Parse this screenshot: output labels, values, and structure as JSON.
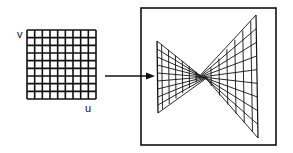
{
  "figure": {
    "colors": {
      "ink": "#111111",
      "background": "#ffffff"
    },
    "source_grid": {
      "axis_labels": {
        "v": "v",
        "u": "u"
      },
      "x": 27,
      "y": 30,
      "width": 69,
      "height": 69,
      "cols": 9,
      "rows": 9
    },
    "arrow": {
      "x1": 105,
      "y1": 76,
      "x2": 155,
      "y2": 76
    },
    "frame": {
      "x": 141,
      "y": 8,
      "width": 135,
      "height": 137
    },
    "surface": {
      "center": [
        203,
        77
      ],
      "left_edge": {
        "top": [
          157,
          41
        ],
        "bottom": [
          158,
          113
        ]
      },
      "right_edge": {
        "top": [
          256,
          15
        ],
        "bottom": [
          258,
          138
        ]
      },
      "rulings": 9,
      "cross_sections": [
        0.15,
        0.3,
        0.45,
        0.6,
        0.75,
        0.9,
        1.0
      ]
    }
  }
}
